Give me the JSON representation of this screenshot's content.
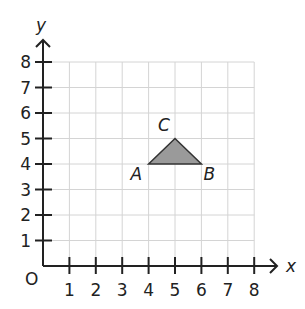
{
  "diagram": {
    "type": "coordinate-grid",
    "origin_label": "O",
    "x_axis": {
      "label": "x",
      "min": 0,
      "max": 8,
      "ticks": [
        "1",
        "2",
        "3",
        "4",
        "5",
        "6",
        "7",
        "8"
      ]
    },
    "y_axis": {
      "label": "y",
      "min": 0,
      "max": 8,
      "ticks": [
        "1",
        "2",
        "3",
        "4",
        "5",
        "6",
        "7",
        "8"
      ]
    },
    "grid": {
      "on": true,
      "color": "#d4d4d4"
    },
    "shapes": [
      {
        "name": "triangle-ABC",
        "fill": "#9a9a9a",
        "stroke": "#333333",
        "vertices": [
          {
            "label": "A",
            "x": 4,
            "y": 4
          },
          {
            "label": "B",
            "x": 6,
            "y": 4
          },
          {
            "label": "C",
            "x": 5,
            "y": 5
          }
        ]
      }
    ]
  }
}
